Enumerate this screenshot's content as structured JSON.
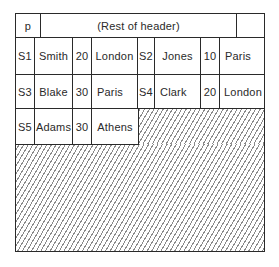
{
  "header": {
    "page_label": "p",
    "rest_label": "(Rest of header)",
    "trailer": ""
  },
  "records": [
    {
      "sno": "S1",
      "sname": "Smith",
      "status": "20",
      "city": "London"
    },
    {
      "sno": "S2",
      "sname": "Jones",
      "status": "10",
      "city": "Paris"
    },
    {
      "sno": "S3",
      "sname": "Blake",
      "status": "30",
      "city": "Paris"
    },
    {
      "sno": "S4",
      "sname": "Clark",
      "status": "20",
      "city": "London"
    },
    {
      "sno": "S5",
      "sname": "Adams",
      "status": "30",
      "city": "Athens"
    }
  ],
  "free_space": {
    "pattern": "diagonal-hatch",
    "color": "#8a8a8a"
  },
  "colors": {
    "line": "#2a2a2a",
    "background": "#ffffff"
  }
}
